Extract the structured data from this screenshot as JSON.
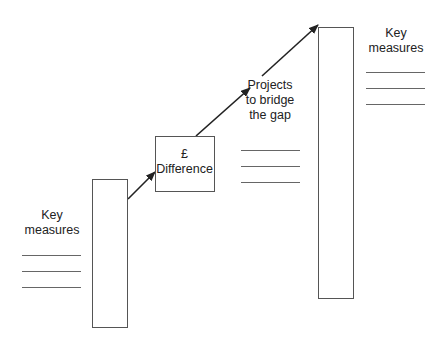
{
  "diagram": {
    "title": "",
    "left": {
      "label_line1": "Key",
      "label_line2": "measures",
      "measure_lines": 3
    },
    "gap_box": {
      "line1": "£",
      "line2": "Difference"
    },
    "projects": {
      "line1": "Projects",
      "line2": "to bridge",
      "line3": "the gap",
      "measure_lines": 3
    },
    "right": {
      "label_line1": "Key",
      "label_line2": "measures",
      "measure_lines": 3
    },
    "colors": {
      "stroke": "#555555",
      "arrow": "#222222",
      "text": "#222222",
      "background": "#ffffff"
    }
  }
}
